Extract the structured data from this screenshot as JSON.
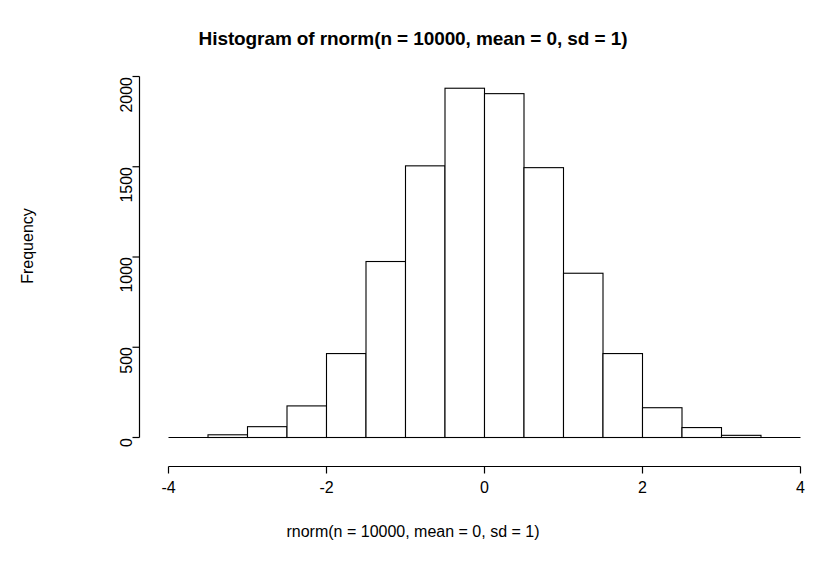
{
  "chart_data": {
    "type": "bar",
    "subtype": "histogram",
    "title": "Histogram of rnorm(n = 10000, mean = 0, sd = 1)",
    "xlabel": "rnorm(n = 10000, mean = 0, sd = 1)",
    "ylabel": "Frequency",
    "xlim": [
      -4,
      4
    ],
    "ylim": [
      0,
      2000
    ],
    "grid": false,
    "legend": null,
    "bin_width": 0.5,
    "bin_edges": [
      -3.5,
      -3.0,
      -2.5,
      -2.0,
      -1.5,
      -1.0,
      -0.5,
      0.0,
      0.5,
      1.0,
      1.5,
      2.0,
      2.5,
      3.0,
      3.5
    ],
    "categories": [
      "-3.5 to -3.0",
      "-3.0 to -2.5",
      "-2.5 to -2.0",
      "-2.0 to -1.5",
      "-1.5 to -1.0",
      "-1.0 to -0.5",
      "-0.5 to 0.0",
      "0.0 to 0.5",
      "0.5 to 1.0",
      "1.0 to 1.5",
      "1.5 to 2.0",
      "2.0 to 2.5",
      "2.5 to 3.0",
      "3.0 to 3.5"
    ],
    "values": [
      15,
      60,
      175,
      465,
      975,
      1505,
      1935,
      1905,
      1495,
      910,
      465,
      165,
      55,
      12
    ],
    "x_ticks": [
      -4,
      -2,
      0,
      2,
      4
    ],
    "x_tick_labels": [
      "-4",
      "-2",
      "0",
      "2",
      "4"
    ],
    "y_ticks": [
      0,
      500,
      1000,
      1500,
      2000
    ],
    "y_tick_labels": [
      "0",
      "500",
      "1000",
      "1500",
      "2000"
    ],
    "bar_fill": "#ffffff",
    "bar_stroke": "#000000",
    "axis_color": "#000000",
    "background": "#ffffff"
  }
}
